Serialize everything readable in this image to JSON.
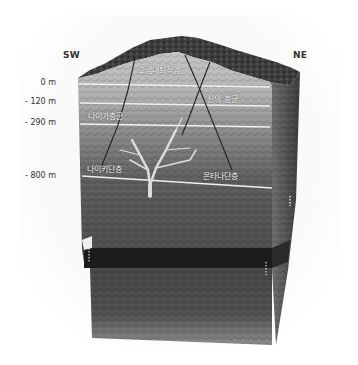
{
  "diagram": {
    "type": "geological-block-cross-section",
    "orientation": {
      "left": "SW",
      "right": "NE"
    },
    "depth_markers": [
      {
        "label": "0 m",
        "y": 78
      },
      {
        "label": "- 120 m",
        "y": 97
      },
      {
        "label": "- 290 m",
        "y": 118
      },
      {
        "label": "- 800 m",
        "y": 171
      }
    ],
    "layer_labels": [
      {
        "id": "top-sedimentary",
        "text": "고생대퇴적암",
        "x": 138,
        "y": 64
      },
      {
        "id": "right-group",
        "text": "신의 층군",
        "x": 207,
        "y": 93
      },
      {
        "id": "left-group",
        "text": "나이가층군",
        "x": 88,
        "y": 110
      },
      {
        "id": "left-fault",
        "text": "나이키단층",
        "x": 87,
        "y": 163
      },
      {
        "id": "right-fault",
        "text": "몬타나단층",
        "x": 203,
        "y": 170
      }
    ],
    "colors": {
      "surface_top": "#3a3a3a",
      "upper_rock": "#b9b9b9",
      "middle_rock": "#8d8d8d",
      "lower_rock": "#575757",
      "dark_band": "#1c1c1c",
      "deep_rock": "#4a4a4a",
      "side_face": "#5e5e5e",
      "boundary_line": "#f0f0f0",
      "fault_line": "#222222",
      "vein": "#d8d8d8"
    }
  }
}
